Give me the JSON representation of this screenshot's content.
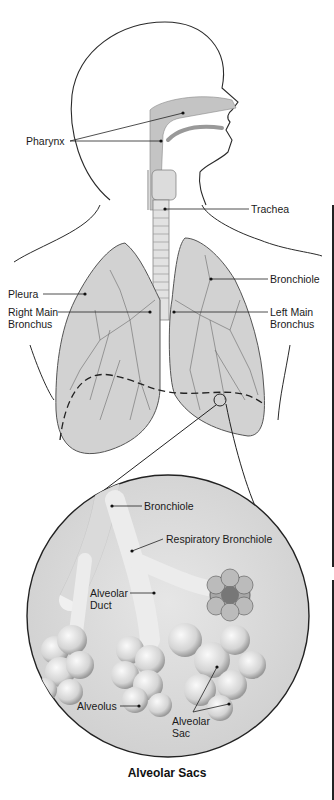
{
  "labels": {
    "pharynx": "Pharynx",
    "trachea": "Trachea",
    "bronchiole_upper": "Bronchiole",
    "pleura": "Pleura",
    "right_main_bronchus": "Right Main\nBronchus",
    "left_main_bronchus": "Left Main\nBronchus",
    "bronchiole_inset": "Bronchiole",
    "respiratory_bronchiole": "Respiratory Bronchiole",
    "alveolar_duct": "Alveolar\nDuct",
    "alveolus": "Alveolus",
    "alveolar_sac": "Alveolar\nSac"
  },
  "caption": "Alveolar Sacs",
  "colors": {
    "outline": "#2a2a2a",
    "tissue": "#c9c9c9",
    "tissue_light": "#e4e4e4",
    "inset_bg": "#d8d8d8",
    "leader": "#222222"
  }
}
